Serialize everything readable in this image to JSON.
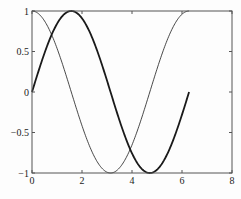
{
  "chart_data": {
    "type": "line",
    "title": "",
    "xlabel": "",
    "ylabel": "",
    "xlim": [
      0,
      8
    ],
    "ylim": [
      -1,
      1
    ],
    "grid": false,
    "legend": null,
    "xticks": [
      0,
      2,
      4,
      6,
      8
    ],
    "yticks": [
      -1,
      -0.5,
      0,
      0.5,
      1
    ],
    "xtick_labels": [
      "0",
      "2",
      "4",
      "6",
      "8"
    ],
    "ytick_labels": [
      "−1",
      "−0.5",
      "0",
      "0.5",
      "1"
    ],
    "series": [
      {
        "name": "sin(x)",
        "style": "thick",
        "x_range": [
          0,
          6.2832
        ],
        "function": "sin",
        "x": [
          0,
          0.785,
          1.571,
          2.356,
          3.142,
          3.927,
          4.712,
          5.498,
          6.283
        ],
        "values": [
          0,
          0.707,
          1,
          0.707,
          0,
          -0.707,
          -1,
          -0.707,
          0
        ]
      },
      {
        "name": "cos(x)",
        "style": "thin",
        "x_range": [
          0,
          6.2832
        ],
        "function": "cos",
        "x": [
          0,
          0.785,
          1.571,
          2.356,
          3.142,
          3.927,
          4.712,
          5.498,
          6.283
        ],
        "values": [
          1,
          0.707,
          0,
          -0.707,
          -1,
          -0.707,
          0,
          0.707,
          1
        ]
      }
    ]
  },
  "plot": {
    "left": 32,
    "right": 232,
    "top": 11,
    "bottom": 173,
    "line_color": "#1a1a1a",
    "axis_color": "#555555"
  }
}
